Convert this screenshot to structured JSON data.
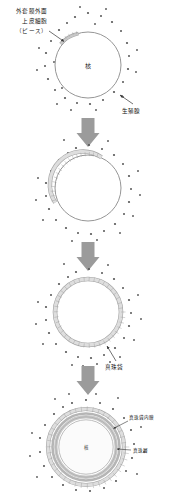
{
  "figure": {
    "background_color": "#ffffff",
    "width": 173,
    "height": 495
  },
  "colors": {
    "outline": "#8a8a8a",
    "cell_fill": "#e2e2e2",
    "cell_stroke": "#9a9a9a",
    "granule": "#555555",
    "arrow": "#9b9b9b",
    "nacre": "#c9c9c9",
    "inner_membrane": "#b5b5b5",
    "text": "#111111",
    "leader": "#333333"
  },
  "labels": {
    "mantle_epithelium_line1": "外套膜外面",
    "mantle_epithelium_line2": "上皮細胞",
    "mantle_epithelium_line3": "（ピース）",
    "gonad": "生殖腺",
    "pearl_sac": "真珠袋",
    "pearl_sac_inner_membrane": "真珠袋内膜",
    "nacre_layer": "真珠層",
    "nucleus": "核"
  },
  "stages": [
    {
      "id": "stage-1",
      "order": 1,
      "nucleus_label": "核",
      "description": "核と移植片（ピース）の挿入",
      "cell_coverage_percent": 12,
      "has_nucleus_label": true,
      "circle": {
        "cx": 88,
        "cy": 65,
        "r": 33
      }
    },
    {
      "id": "stage-2",
      "order": 2,
      "nucleus_label": "",
      "description": "上皮細胞の増殖開始",
      "cell_coverage_percent": 45,
      "has_nucleus_label": false,
      "circle": {
        "cx": 88,
        "cy": 188,
        "r": 33
      }
    },
    {
      "id": "stage-3",
      "order": 3,
      "nucleus_label": "",
      "description": "真珠袋の完成",
      "cell_coverage_percent": 100,
      "has_nucleus_label": false,
      "circle": {
        "cx": 88,
        "cy": 312,
        "r": 33
      }
    },
    {
      "id": "stage-4",
      "order": 4,
      "nucleus_label": "核",
      "description": "真珠層の沈着",
      "cell_coverage_percent": 100,
      "has_nucleus_label": true,
      "circle": {
        "cx": 86,
        "cy": 447,
        "r": 38
      }
    }
  ],
  "arrows": [
    {
      "id": "arrow-1",
      "from": "stage-1",
      "to": "stage-2"
    },
    {
      "id": "arrow-2",
      "from": "stage-2",
      "to": "stage-3"
    },
    {
      "id": "arrow-3",
      "from": "stage-3",
      "to": "stage-4"
    }
  ]
}
